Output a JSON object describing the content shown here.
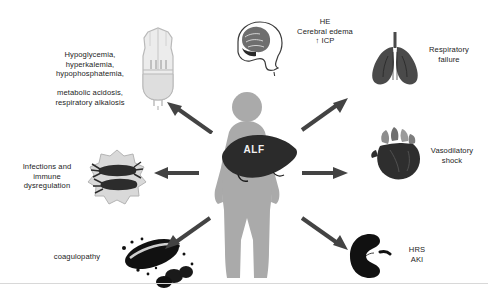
{
  "figure": {
    "center": {
      "organ_label": "ALF",
      "body_name": "patient-silhouette",
      "liver_name": "liver"
    },
    "nodes": [
      {
        "id": "metabolic",
        "label": "Hypoglycemia,\nhyperkalemia,\nhypophosphatemia,\n\nmetabolic acidosis,\nrespiratory alkalosis",
        "icon": "iv-fluid-bag-icon",
        "position": "top-left"
      },
      {
        "id": "neurologic",
        "label": "HE\nCerebral edema\n↑ ICP",
        "icon": "brain-head-icon",
        "position": "top-center"
      },
      {
        "id": "respiratory",
        "label": "Respiratory\nfailure",
        "icon": "lungs-icon",
        "position": "top-right"
      },
      {
        "id": "cardiovascular",
        "label": "Vasodilatory\nshock",
        "icon": "heart-icon",
        "position": "right"
      },
      {
        "id": "renal",
        "label": "HRS\nAKI",
        "icon": "kidney-icon",
        "position": "bottom-right"
      },
      {
        "id": "coagulation",
        "label": "coagulopathy",
        "icon": "blood-clot-icon",
        "position": "bottom-left"
      },
      {
        "id": "immune",
        "label": "Infections and\nimmune\ndysregulation",
        "icon": "immune-cells-icon",
        "position": "left"
      }
    ],
    "colors": {
      "arrow": "#434343",
      "body": "#aaaaaa",
      "liver": "#2b2b2b",
      "text": "#1c1c1c",
      "background": "#ffffff",
      "lungs": "#4a4a4a",
      "kidney": "#111111",
      "heart_dark": "#2e2e2e",
      "heart_light": "#8d8d8d"
    }
  }
}
